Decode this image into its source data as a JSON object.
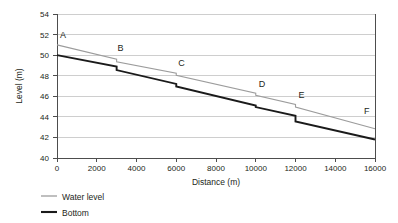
{
  "chart_data": {
    "type": "line",
    "title": "",
    "xlabel": "Distance (m)",
    "ylabel": "Level (m)",
    "xlim": [
      0,
      16000
    ],
    "ylim": [
      40,
      54
    ],
    "xticks": [
      0,
      2000,
      4000,
      6000,
      8000,
      10000,
      12000,
      14000,
      16000
    ],
    "yticks": [
      40,
      42,
      44,
      46,
      48,
      50,
      52,
      54
    ],
    "xtick_labels": [
      "0",
      "2000",
      "4000",
      "6000",
      "8000",
      "10000",
      "12000",
      "14000",
      "16000"
    ],
    "ytick_labels": [
      "40",
      "42",
      "44",
      "46",
      "48",
      "50",
      "52",
      "54"
    ],
    "grid": "horizontal",
    "legend_position": "below-left",
    "series": [
      {
        "name": "Water level",
        "color": "#9c9c9c",
        "style": "step-drop",
        "x": [
          0,
          3000,
          3000,
          6000,
          6000,
          10000,
          10000,
          12000,
          12000,
          16000
        ],
        "y": [
          51.0,
          49.6,
          49.35,
          48.25,
          48.05,
          46.3,
          46.1,
          45.2,
          44.95,
          42.85
        ]
      },
      {
        "name": "Bottom",
        "color": "#1a1a1a",
        "style": "step-drop",
        "x": [
          0,
          3000,
          3000,
          6000,
          6000,
          10000,
          10000,
          12000,
          12000,
          16000
        ],
        "y": [
          50.0,
          48.9,
          48.55,
          47.2,
          46.95,
          45.1,
          44.95,
          44.1,
          43.55,
          41.8
        ]
      }
    ],
    "annotations": [
      {
        "label": "A",
        "x": 150,
        "y": 51.7
      },
      {
        "label": "B",
        "x": 3050,
        "y": 50.45
      },
      {
        "label": "C",
        "x": 6100,
        "y": 48.95
      },
      {
        "label": "D",
        "x": 10150,
        "y": 46.95
      },
      {
        "label": "E",
        "x": 12150,
        "y": 45.85
      },
      {
        "label": "F",
        "x": 15450,
        "y": 44.25
      }
    ]
  },
  "legend": {
    "items": [
      {
        "label": "Water level",
        "color": "#9c9c9c"
      },
      {
        "label": "Bottom",
        "color": "#1a1a1a"
      }
    ]
  }
}
